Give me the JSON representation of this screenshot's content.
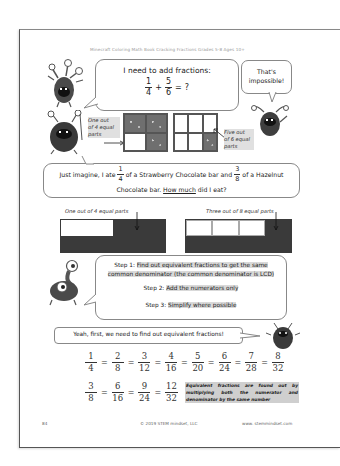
{
  "header": {
    "book_title": "Minecraft Coloring Math Book Cracking Fractions Grades 5-8 Ages 10+"
  },
  "intro_bubble": {
    "text": "I need to add fractions:",
    "equation": {
      "a_num": "1",
      "a_den": "4",
      "op": "+",
      "b_num": "5",
      "b_den": "6",
      "eq": "=",
      "result": "?"
    }
  },
  "reply_bubble": {
    "line1": "That's",
    "line2": "impossible!"
  },
  "left_label": {
    "lines": [
      "One   out",
      "of 4 equal",
      "parts"
    ]
  },
  "right_label": {
    "lines": [
      "Five   out",
      "of 6 equal",
      "parts"
    ]
  },
  "story_bubble": {
    "part1": "Just imagine, I ate",
    "frac1": {
      "num": "1",
      "den": "4"
    },
    "part2": "of a Strawberry Chocolate bar and",
    "frac2": {
      "num": "3",
      "den": "8"
    },
    "part3": "of a Hazelnut",
    "line2_pre": "Chocolate bar.",
    "line2_underline": "How much",
    "line2_post": "did I eat?"
  },
  "bars": {
    "left_caption": "One out of 4 equal parts",
    "right_caption": "Three out of 8 equal parts"
  },
  "steps_bubble": {
    "step1_label": "Step 1:",
    "step1_text_a": "Find out equivalent fractions to get the same",
    "step1_text_b": "common denominator (the common denominator is LCD)",
    "step2_label": "Step 2:",
    "step2_text": "Add the numerators only",
    "step3_label": "Step 3:",
    "step3_text": "Simplify where possible"
  },
  "yeah_bubble": {
    "text": "Yeah, first, we need to find out equivalent fractions!"
  },
  "equivalents": {
    "row1": [
      {
        "n": "1",
        "d": "4"
      },
      {
        "n": "2",
        "d": "8"
      },
      {
        "n": "3",
        "d": "12"
      },
      {
        "n": "4",
        "d": "16"
      },
      {
        "n": "5",
        "d": "20"
      },
      {
        "n": "6",
        "d": "24"
      },
      {
        "n": "7",
        "d": "28"
      },
      {
        "n": "8",
        "d": "32"
      }
    ],
    "row2": [
      {
        "n": "3",
        "d": "8"
      },
      {
        "n": "6",
        "d": "16"
      },
      {
        "n": "9",
        "d": "24"
      },
      {
        "n": "12",
        "d": "32"
      }
    ],
    "equals": "="
  },
  "note": {
    "text": "Equivalent fractions are found out by multiplying both the numerator and denominator by the same number"
  },
  "footer": {
    "page_number": "84",
    "copyright": "© 2019 STEM mindset, LLC",
    "website": "www. stemmindset.com"
  },
  "colors": {
    "dark_fill": "#3a3a3a",
    "highlight": "#d9d9d9",
    "border": "#555555"
  }
}
